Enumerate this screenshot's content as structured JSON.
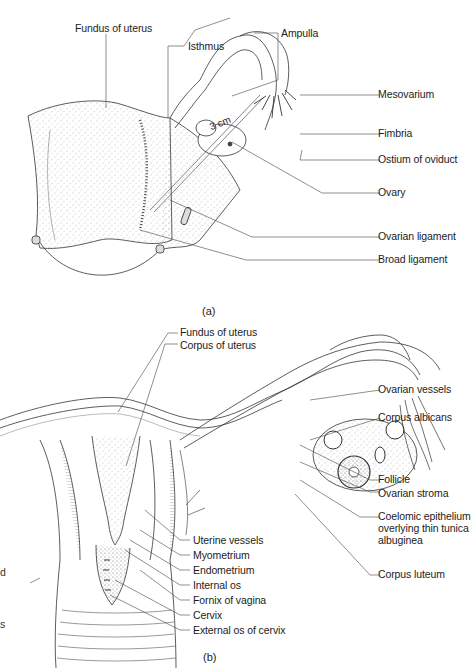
{
  "figure_a": {
    "panel_label": "(a)",
    "measure_label": "3 cm",
    "labels": {
      "fundus": "Fundus of uterus",
      "isthmus": "Isthmus",
      "ampulla": "Ampulla",
      "mesovarium": "Mesovarium",
      "fimbria": "Fimbria",
      "ostium": "Ostium of oviduct",
      "ovary": "Ovary",
      "ovarian_ligament": "Ovarian ligament",
      "broad_ligament": "Broad ligament"
    }
  },
  "figure_b": {
    "panel_label": "(b)",
    "labels": {
      "fundus": "Fundus of uterus",
      "corpus": "Corpus of uterus",
      "ovarian_vessels": "Ovarian vessels",
      "corpus_albicans": "Corpus albicans",
      "follicle": "Follicle",
      "ovarian_stroma": "Ovarian stroma",
      "coelomic": "Coelomic epithelium overlying thin tunica albuginea",
      "corpus_luteum": "Corpus luteum",
      "uterine_vessels": "Uterine vessels",
      "myometrium": "Myometrium",
      "endometrium": "Endometrium",
      "internal_os": "Internal os",
      "fornix": "Fornix of vagina",
      "cervix": "Cervix",
      "external_os": "External os of cervix"
    },
    "clipped_fragments": [
      "d",
      "s"
    ]
  }
}
